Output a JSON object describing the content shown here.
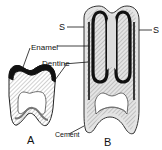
{
  "labels": {
    "s_left": "S",
    "s_right": "S",
    "enamel": "Enamel",
    "dentine": "Dentine",
    "cement": "Cement",
    "tooth_a": "A",
    "tooth_b": "B"
  },
  "colors": {
    "enamel": "#111111",
    "outline": "#222222",
    "hatch": "#8a8a8a",
    "cement_fill": "#d8d8d8",
    "background": "#ffffff"
  }
}
